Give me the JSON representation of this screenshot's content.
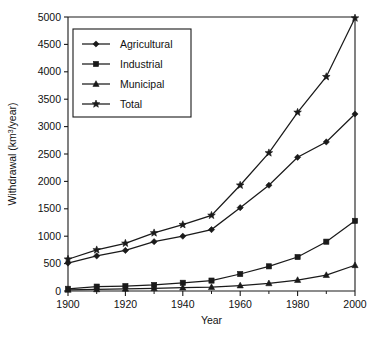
{
  "chart_data": {
    "type": "line",
    "title": "",
    "xlabel": "Year",
    "ylabel": "Withdrawal (km3/year)",
    "ylabel_parts": {
      "pre": "Withdrawal (km",
      "sup": "3",
      "post": "/year)"
    },
    "xlim": [
      1900,
      2000
    ],
    "ylim": [
      0,
      5000
    ],
    "x": [
      1900,
      1910,
      1920,
      1930,
      1940,
      1950,
      1960,
      1970,
      1980,
      1990,
      2000
    ],
    "xticks": [
      1900,
      1920,
      1940,
      1960,
      1980,
      2000
    ],
    "xtick_labels": [
      "1900",
      "1920",
      "1940",
      "1960",
      "1980",
      "2000"
    ],
    "xticks_minor": [
      1910,
      1930,
      1950,
      1970,
      1990
    ],
    "yticks": [
      0,
      500,
      1000,
      1500,
      2000,
      2500,
      3000,
      3500,
      4000,
      4500,
      5000
    ],
    "ytick_labels": [
      "0",
      "500",
      "1000",
      "1500",
      "2000",
      "2500",
      "3000",
      "3500",
      "4000",
      "4500",
      "5000"
    ],
    "grid": false,
    "legend_position": "upper-left-inside",
    "series": [
      {
        "name": "Agricultural",
        "marker": "diamond",
        "color": "#1a1a1a",
        "values": [
          510,
          640,
          740,
          900,
          1000,
          1120,
          1520,
          1930,
          2440,
          2720,
          3230
        ]
      },
      {
        "name": "Industrial",
        "marker": "square",
        "color": "#1a1a1a",
        "values": [
          40,
          80,
          90,
          110,
          150,
          190,
          310,
          450,
          620,
          900,
          1280
        ]
      },
      {
        "name": "Municipal",
        "marker": "triangle",
        "color": "#1a1a1a",
        "values": [
          20,
          30,
          40,
          50,
          60,
          70,
          100,
          140,
          200,
          290,
          470
        ]
      },
      {
        "name": "Total",
        "marker": "star",
        "color": "#1a1a1a",
        "values": [
          580,
          750,
          870,
          1060,
          1210,
          1380,
          1930,
          2520,
          3260,
          3910,
          4980
        ]
      }
    ]
  }
}
